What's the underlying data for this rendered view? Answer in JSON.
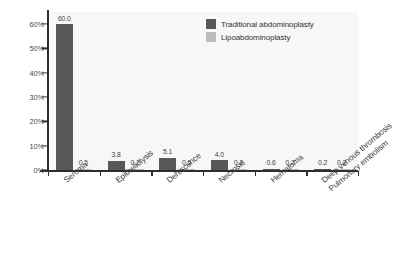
{
  "chart_data": {
    "type": "bar",
    "title": "",
    "xlabel": "",
    "ylabel": "",
    "ylim": [
      0,
      65
    ],
    "yticks": [
      "0%",
      "10%",
      "20%",
      "30%",
      "40%",
      "50%",
      "60%"
    ],
    "ytick_values": [
      0,
      10,
      20,
      30,
      40,
      50,
      60
    ],
    "grid": false,
    "legend_position": "top-right",
    "categories": [
      "Seroma",
      "Epitheliolysis",
      "Dehiscence",
      "Necrosis",
      "Hematoma",
      "Deep venous thrombosis Pulmonary embolism"
    ],
    "category_lines": [
      [
        "Seroma"
      ],
      [
        "Epitheliolysis"
      ],
      [
        "Dehiscence"
      ],
      [
        "Necrosis"
      ],
      [
        "Hematoma"
      ],
      [
        "Deep venous thrombosis",
        "Pulmonary embolism"
      ]
    ],
    "series": [
      {
        "name": "Traditional abdominoplasty",
        "color": "#575757",
        "values": [
          60.0,
          3.8,
          5.1,
          4.0,
          0.6,
          0.2
        ],
        "labels": [
          "60.0",
          "3.8",
          "5.1",
          "4.0",
          "0.6",
          "0.2"
        ]
      },
      {
        "name": "Lipoabdominoplasty",
        "color": "#bdbdbd",
        "values": [
          0.5,
          0.2,
          0.5,
          0.2,
          0.2,
          0.2
        ],
        "labels": [
          "0.5",
          "0.2",
          "0.5",
          "0.2",
          "0.2",
          "0.2"
        ]
      }
    ]
  },
  "legend": {
    "items": [
      {
        "label": "Traditional abdominoplasty",
        "color": "#575757"
      },
      {
        "label": "Lipoabdominoplasty",
        "color": "#bdbdbd"
      }
    ]
  },
  "colors": {
    "series_dark": "#575757",
    "series_light": "#bdbdbd",
    "axis": "#2e2e2e",
    "plot_background": "#f7f7f7",
    "text": "#3a3a3a"
  }
}
